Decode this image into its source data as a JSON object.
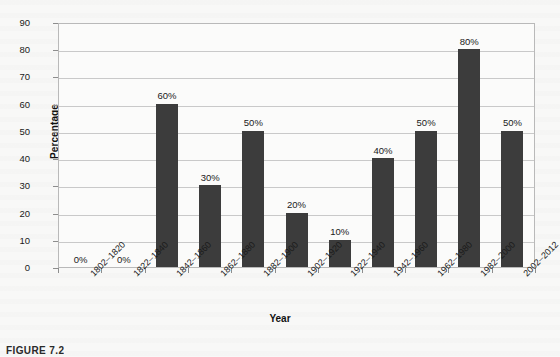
{
  "chart_data": {
    "type": "bar",
    "title": "",
    "xlabel": "Year",
    "ylabel": "Percentage",
    "ylim": [
      0,
      90
    ],
    "ytick_step": 10,
    "yticks": [
      90,
      80,
      70,
      60,
      50,
      40,
      30,
      20,
      10,
      0
    ],
    "grid": true,
    "legend": null,
    "bar_color": "#3c3c3c",
    "categories": [
      "1802–1820",
      "1822–1840",
      "1842–1860",
      "1862–1880",
      "1882–1900",
      "1902–1920",
      "1922–1940",
      "1942–1960",
      "1962–1980",
      "1982–2000",
      "2002–2012"
    ],
    "values": [
      0,
      0,
      60,
      30,
      50,
      20,
      10,
      40,
      50,
      80,
      50
    ],
    "data_labels": [
      "0%",
      "0%",
      "60%",
      "30%",
      "50%",
      "20%",
      "10%",
      "40%",
      "50%",
      "80%",
      "50%"
    ]
  },
  "caption": {
    "text": "FIGURE 7.2"
  }
}
